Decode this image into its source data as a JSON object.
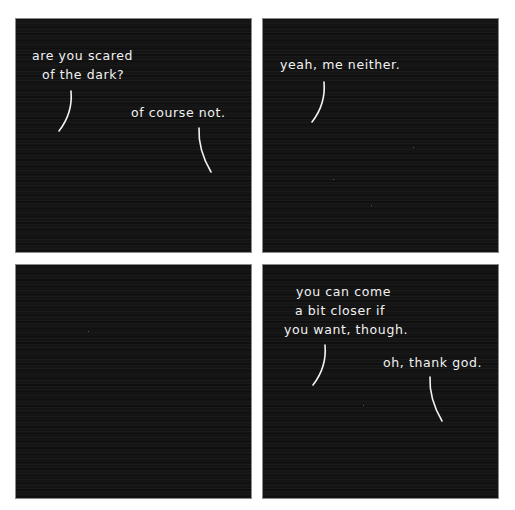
{
  "comic": {
    "panels": [
      {
        "id": 1,
        "balloons": [
          {
            "speaker": "left",
            "lines": [
              "are you scared",
              "of the dark?"
            ]
          },
          {
            "speaker": "right",
            "lines": [
              "of course not."
            ]
          }
        ]
      },
      {
        "id": 2,
        "balloons": [
          {
            "speaker": "left",
            "lines": [
              "yeah, me neither."
            ]
          }
        ]
      },
      {
        "id": 3,
        "balloons": []
      },
      {
        "id": 4,
        "balloons": [
          {
            "speaker": "left",
            "lines": [
              "you can come",
              "a bit closer if",
              "you want, though."
            ]
          },
          {
            "speaker": "right",
            "lines": [
              "oh, thank god."
            ]
          }
        ]
      }
    ],
    "colors": {
      "panel_background": "#141414",
      "text": "#f2f2f2",
      "gutter": "#ffffff"
    }
  }
}
